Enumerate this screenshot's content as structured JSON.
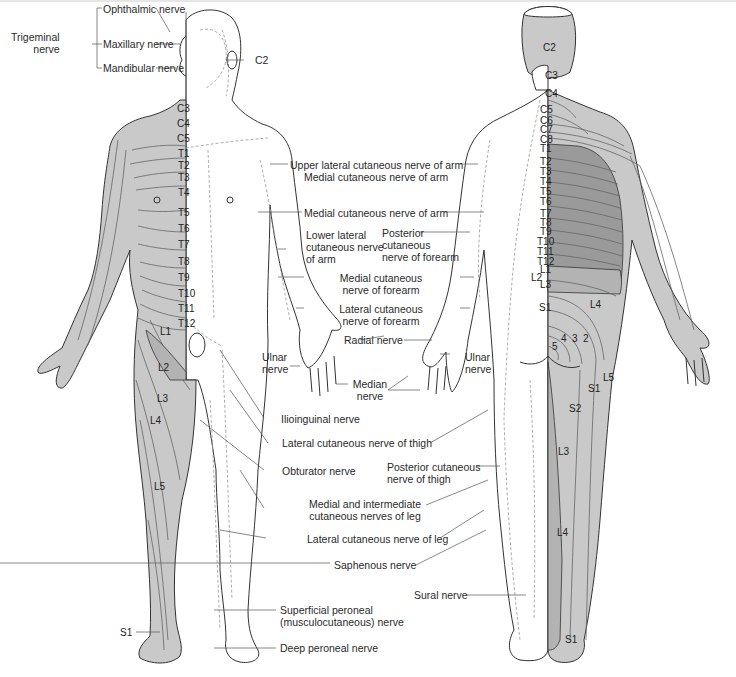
{
  "diagram": {
    "type": "dermatome-and-cutaneous-nerve-map",
    "colors": {
      "dermatome_fill": "#c9c9c9",
      "dermatome_dark": "#9a9a9a",
      "dermatome_mid": "#b3b3b3",
      "outline": "#333333",
      "nerve_dash": "#999999",
      "background": "#ffffff"
    },
    "front_view": {
      "trigeminal": {
        "group": "Trigeminal nerve",
        "group_line1": "Trigeminal",
        "group_line2": "nerve",
        "branches": [
          "Ophthalmic nerve",
          "Maxillary nerve",
          "Mandibular nerve"
        ]
      },
      "c2": "C2",
      "trunk_segments": [
        "C3",
        "C4",
        "C5",
        "T1",
        "T2",
        "T3",
        "T4",
        "T5",
        "T6",
        "T7",
        "T8",
        "T9",
        "T10",
        "T11",
        "T12"
      ],
      "leg_segments": [
        "L1",
        "L2",
        "L3",
        "L4",
        "L5",
        "S1"
      ]
    },
    "back_view": {
      "segments": [
        "C2",
        "C3",
        "C4",
        "C5",
        "C6",
        "C7",
        "C8",
        "T1",
        "T2",
        "T3",
        "T4",
        "T5",
        "T6",
        "T7",
        "T8",
        "T9",
        "T10",
        "T11",
        "T12",
        "L1",
        "L2",
        "L3",
        "S1",
        "L4",
        "5",
        "4",
        "3",
        "2",
        "S1",
        "L5",
        "S2",
        "L3",
        "L4",
        "S1"
      ]
    },
    "nerve_labels": {
      "upper_lateral_arm": "Upper lateral cutaneous nerve of arm",
      "medial_arm_1": "Medial cutaneous nerve of arm",
      "medial_arm_2": "Medial cutaneous nerve of arm",
      "lower_lateral_l1": "Lower lateral",
      "lower_lateral_l2": "cutaneous nerve",
      "lower_lateral_l3": "of arm",
      "posterior_forearm_l1": "Posterior",
      "posterior_forearm_l2": "cutaneous",
      "posterior_forearm_l3": "nerve of forearm",
      "medial_forearm_l1": "Medial cutaneous",
      "medial_forearm_l2": "nerve of forearm",
      "lateral_forearm_l1": "Lateral cutaneous",
      "lateral_forearm_l2": "nerve of forearm",
      "radial": "Radial nerve",
      "ulnar_front_l1": "Ulnar",
      "ulnar_front_l2": "nerve",
      "ulnar_back_l1": "Ulnar",
      "ulnar_back_l2": "nerve",
      "median_l1": "Median",
      "median_l2": "nerve",
      "ilioinguinal": "Ilioinguinal nerve",
      "lateral_thigh": "Lateral cutaneous nerve of thigh",
      "obturator": "Obturator nerve",
      "posterior_thigh_l1": "Posterior cutaneous",
      "posterior_thigh_l2": "nerve of thigh",
      "medial_intermediate_l1": "Medial and intermediate",
      "medial_intermediate_l2": "cutaneous nerves of leg",
      "lateral_leg": "Lateral cutaneous nerve of leg",
      "saphenous": "Saphenous nerve",
      "sural": "Sural nerve",
      "superficial_peroneal_l1": "Superficial peroneal",
      "superficial_peroneal_l2": "(musculocutaneous) nerve",
      "deep_peroneal": "Deep peroneal nerve"
    }
  }
}
